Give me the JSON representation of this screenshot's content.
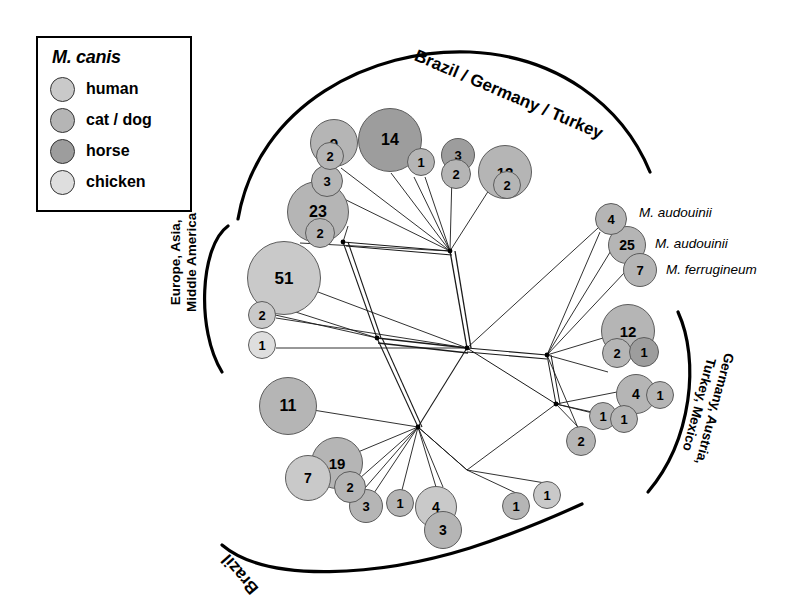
{
  "legend": {
    "title": "M. canis",
    "items": [
      {
        "label": "human",
        "color": "#c9c9c9"
      },
      {
        "label": "cat / dog",
        "color": "#b5b5b5"
      },
      {
        "label": "horse",
        "color": "#9d9d9d"
      },
      {
        "label": "chicken",
        "color": "#dedede"
      }
    ]
  },
  "groups": {
    "top": "Brazil / Germany / Turkey",
    "left": "Europe, Asia,\nMiddle America",
    "left_line1": "Europe, Asia,",
    "left_line2": "Middle America",
    "right_line1": "Germany, Austria,",
    "right_line2": "Turkey, Mexico",
    "bottom": "Brazil"
  },
  "species_labels": [
    {
      "text": "M. audouinii",
      "for_node": "4"
    },
    {
      "text": "M. audouinii",
      "for_node": "25"
    },
    {
      "text": "M. ferrugineum",
      "for_node": "7"
    }
  ],
  "chart_data": {
    "type": "network",
    "host_colors": {
      "human": "#c9c9c9",
      "cat_dog": "#b5b5b5",
      "horse": "#9d9d9d",
      "chicken": "#dedede"
    },
    "geographic_groups": [
      "Brazil / Germany / Turkey",
      "Europe, Asia, Middle America",
      "Germany, Austria, Turkey, Mexico",
      "Brazil"
    ],
    "nodes": [
      {
        "id": "n9",
        "value": 9,
        "host": "cat_dog",
        "x": 334,
        "y": 143,
        "r": 24,
        "fs": 15,
        "group": "Brazil / Germany / Turkey"
      },
      {
        "id": "n9i",
        "value": 2,
        "host": "cat_dog",
        "x": 330,
        "y": 156,
        "r": 14,
        "fs": 13,
        "nested_in": "n9"
      },
      {
        "id": "n3a",
        "value": 3,
        "host": "cat_dog",
        "x": 327,
        "y": 181,
        "r": 16,
        "fs": 13,
        "group": "Brazil / Germany / Turkey"
      },
      {
        "id": "n14",
        "value": 14,
        "host": "horse",
        "x": 390,
        "y": 140,
        "r": 32,
        "fs": 16,
        "group": "Brazil / Germany / Turkey"
      },
      {
        "id": "n1a",
        "value": 1,
        "host": "cat_dog",
        "x": 421,
        "y": 162,
        "r": 14,
        "fs": 13,
        "group": "Brazil / Germany / Turkey"
      },
      {
        "id": "n3b",
        "value": 3,
        "host": "horse",
        "x": 458,
        "y": 155,
        "r": 17,
        "fs": 13,
        "group": "Brazil / Germany / Turkey"
      },
      {
        "id": "n3bi",
        "value": 2,
        "host": "cat_dog",
        "x": 456,
        "y": 174,
        "r": 15,
        "fs": 13,
        "nested_in": "n3b"
      },
      {
        "id": "n12a",
        "value": 12,
        "host": "cat_dog",
        "x": 505,
        "y": 172,
        "r": 27,
        "fs": 15,
        "group": "Brazil / Germany / Turkey"
      },
      {
        "id": "n12ai",
        "value": 2,
        "host": "cat_dog",
        "x": 507,
        "y": 185,
        "r": 14,
        "fs": 13,
        "nested_in": "n12a"
      },
      {
        "id": "n23",
        "value": 23,
        "host": "cat_dog",
        "x": 318,
        "y": 212,
        "r": 31,
        "fs": 16,
        "group": "Europe, Asia, Middle America"
      },
      {
        "id": "n23i",
        "value": 2,
        "host": "cat_dog",
        "x": 320,
        "y": 233,
        "r": 15,
        "fs": 13,
        "nested_in": "n23"
      },
      {
        "id": "n51",
        "value": 51,
        "host": "human",
        "x": 284,
        "y": 278,
        "r": 37,
        "fs": 17,
        "group": "Europe, Asia, Middle America"
      },
      {
        "id": "n2a",
        "value": 2,
        "host": "human",
        "x": 262,
        "y": 315,
        "r": 14,
        "fs": 13,
        "group": "Europe, Asia, Middle America"
      },
      {
        "id": "n1b",
        "value": 1,
        "host": "chicken",
        "x": 262,
        "y": 345,
        "r": 14,
        "fs": 13,
        "group": "Europe, Asia, Middle America"
      },
      {
        "id": "n4r",
        "value": 4,
        "host": "cat_dog",
        "x": 611,
        "y": 219,
        "r": 16,
        "fs": 13,
        "species": "M. audouinii"
      },
      {
        "id": "n25",
        "value": 25,
        "host": "cat_dog",
        "x": 627,
        "y": 245,
        "r": 19,
        "fs": 14,
        "species": "M. audouinii"
      },
      {
        "id": "n7r",
        "value": 7,
        "host": "cat_dog",
        "x": 640,
        "y": 270,
        "r": 17,
        "fs": 13,
        "species": "M. ferrugineum"
      },
      {
        "id": "n12b",
        "value": 12,
        "host": "cat_dog",
        "x": 628,
        "y": 331,
        "r": 27,
        "fs": 15,
        "group": "Germany, Austria, Turkey, Mexico"
      },
      {
        "id": "n2r",
        "value": 2,
        "host": "cat_dog",
        "x": 617,
        "y": 353,
        "r": 15,
        "fs": 13,
        "nested_in": "n12b"
      },
      {
        "id": "n1r",
        "value": 1,
        "host": "horse",
        "x": 644,
        "y": 352,
        "r": 15,
        "fs": 13,
        "nested_in": "n12b"
      },
      {
        "id": "n4b",
        "value": 4,
        "host": "cat_dog",
        "x": 636,
        "y": 394,
        "r": 20,
        "fs": 14,
        "group": "Germany, Austria, Turkey, Mexico"
      },
      {
        "id": "n1s",
        "value": 1,
        "host": "cat_dog",
        "x": 660,
        "y": 395,
        "r": 14,
        "fs": 13,
        "group": "Germany, Austria, Turkey, Mexico"
      },
      {
        "id": "n1t",
        "value": 1,
        "host": "cat_dog",
        "x": 603,
        "y": 416,
        "r": 14,
        "fs": 13,
        "group": "Germany, Austria, Turkey, Mexico"
      },
      {
        "id": "n1u",
        "value": 1,
        "host": "cat_dog",
        "x": 624,
        "y": 419,
        "r": 14,
        "fs": 13,
        "group": "Germany, Austria, Turkey, Mexico"
      },
      {
        "id": "n2s",
        "value": 2,
        "host": "cat_dog",
        "x": 581,
        "y": 441,
        "r": 15,
        "fs": 13,
        "group": "Germany, Austria, Turkey, Mexico"
      },
      {
        "id": "n11",
        "value": 11,
        "host": "cat_dog",
        "x": 288,
        "y": 406,
        "r": 29,
        "fs": 16,
        "group": "Brazil"
      },
      {
        "id": "n19",
        "value": 19,
        "host": "cat_dog",
        "x": 337,
        "y": 463,
        "r": 26,
        "fs": 15,
        "group": "Brazil"
      },
      {
        "id": "n7b",
        "value": 7,
        "host": "human",
        "x": 308,
        "y": 478,
        "r": 23,
        "fs": 14,
        "group": "Brazil"
      },
      {
        "id": "n2b",
        "value": 2,
        "host": "cat_dog",
        "x": 350,
        "y": 487,
        "r": 16,
        "fs": 13,
        "group": "Brazil"
      },
      {
        "id": "n3c",
        "value": 3,
        "host": "cat_dog",
        "x": 366,
        "y": 506,
        "r": 17,
        "fs": 13,
        "group": "Brazil"
      },
      {
        "id": "n1v",
        "value": 1,
        "host": "cat_dog",
        "x": 400,
        "y": 503,
        "r": 14,
        "fs": 13,
        "group": "Brazil"
      },
      {
        "id": "n4c",
        "value": 4,
        "host": "human",
        "x": 436,
        "y": 507,
        "r": 21,
        "fs": 14,
        "group": "Brazil"
      },
      {
        "id": "n3d",
        "value": 3,
        "host": "cat_dog",
        "x": 443,
        "y": 530,
        "r": 19,
        "fs": 14,
        "group": "Brazil"
      },
      {
        "id": "n1w",
        "value": 1,
        "host": "cat_dog",
        "x": 516,
        "y": 506,
        "r": 14,
        "fs": 13,
        "group": "Brazil"
      },
      {
        "id": "n1x",
        "value": 1,
        "host": "human",
        "x": 547,
        "y": 495,
        "r": 14,
        "fs": 13,
        "group": "Brazil"
      }
    ],
    "hub_nodes": [
      {
        "id": "h_top",
        "x": 450,
        "y": 251
      },
      {
        "id": "h_upleft",
        "x": 343,
        "y": 242
      },
      {
        "id": "h_mid",
        "x": 377,
        "y": 338
      },
      {
        "id": "h_center",
        "x": 467,
        "y": 348
      },
      {
        "id": "h_low",
        "x": 418,
        "y": 427
      },
      {
        "id": "h_right",
        "x": 547,
        "y": 355
      },
      {
        "id": "h_rlow",
        "x": 556,
        "y": 404
      }
    ]
  }
}
